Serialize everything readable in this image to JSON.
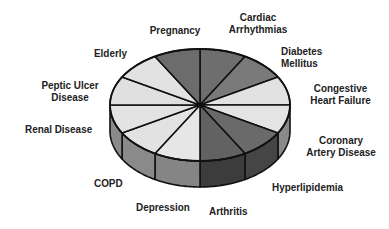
{
  "chart_data": {
    "type": "pie",
    "style": "3d-exploded-none",
    "title": "",
    "slice_count": 12,
    "equal_slices": true,
    "start_angle_deg": 0,
    "direction": "clockwise",
    "categories": [
      "Cardiac Arrhythmias",
      "Diabetes Mellitus",
      "Congestive Heart Failure",
      "Coronary Artery Disease",
      "Hyperlipidemia",
      "Arthritis",
      "Depression",
      "COPD",
      "Renal Disease",
      "Peptic Ulcer Disease",
      "Elderly",
      "Pregnancy"
    ],
    "values": [
      1,
      1,
      1,
      1,
      1,
      1,
      1,
      1,
      1,
      1,
      1,
      1
    ],
    "percentages": [
      8.33,
      8.33,
      8.33,
      8.33,
      8.33,
      8.33,
      8.33,
      8.33,
      8.33,
      8.33,
      8.33,
      8.33
    ],
    "legend": "none (labels placed around pie)",
    "geometry": {
      "cx": 200,
      "cy": 105,
      "rx": 90,
      "ry": 56,
      "depth": 26
    }
  },
  "slices": [
    {
      "label_lines": [
        "Cardiac",
        "Arrhythmias"
      ],
      "top": "#6e6e6e",
      "side": "#4a4a4a"
    },
    {
      "label_lines": [
        "Diabetes",
        "Mellitus"
      ],
      "top": "#7a7a7a",
      "side": "#555555"
    },
    {
      "label_lines": [
        "Congestive",
        "Heart Failure"
      ],
      "top": "#e2e2e2",
      "side": "#8c8c8c"
    },
    {
      "label_lines": [
        "Coronary",
        "Artery Disease"
      ],
      "top": "#e4e4e4",
      "side": "#8a8a8a"
    },
    {
      "label_lines": [
        "Hyperlipidemia"
      ],
      "top": "#6a6a6a",
      "side": "#454545"
    },
    {
      "label_lines": [
        "Arthritis"
      ],
      "top": "#626262",
      "side": "#3c3c3c"
    },
    {
      "label_lines": [
        "Depression"
      ],
      "top": "#e6e6e6",
      "side": "#858585"
    },
    {
      "label_lines": [
        "COPD"
      ],
      "top": "#e2e2e2",
      "side": "#8a8a8a"
    },
    {
      "label_lines": [
        "Renal Disease"
      ],
      "top": "#e3e3e3",
      "side": "#8a8a8a"
    },
    {
      "label_lines": [
        "Peptic Ulcer",
        "Disease"
      ],
      "top": "#e0e0e0",
      "side": "#8a8a8a"
    },
    {
      "label_lines": [
        "Elderly"
      ],
      "top": "#e2e2e2",
      "side": "#8a8a8a"
    },
    {
      "label_lines": [
        "Pregnancy"
      ],
      "top": "#6c6c6c",
      "side": "#4a4a4a"
    }
  ],
  "labels": {
    "cardiac_1": "Cardiac",
    "cardiac_2": "Arrhythmias",
    "diabetes_1": "Diabetes",
    "diabetes_2": "Mellitus",
    "chf_1": "Congestive",
    "chf_2": "Heart Failure",
    "cad_1": "Coronary",
    "cad_2": "Artery Disease",
    "hyperlipidemia": "Hyperlipidemia",
    "arthritis": "Arthritis",
    "depression": "Depression",
    "copd": "COPD",
    "renal": "Renal Disease",
    "peptic_1": "Peptic Ulcer",
    "peptic_2": "Disease",
    "elderly": "Elderly",
    "pregnancy": "Pregnancy"
  },
  "colors": {
    "outline": "#111111",
    "text": "#222222",
    "background": "#ffffff"
  }
}
